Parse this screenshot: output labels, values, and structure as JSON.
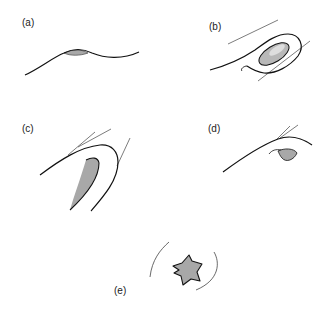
{
  "figure": {
    "panels": [
      {
        "id": "a",
        "label": "(a)",
        "description": "single wavy contour with a thin shaded lens on its crest"
      },
      {
        "id": "b",
        "label": "(b)",
        "description": "contour curving into a rounded loop enclosing a shaded ellipse, with two tangent lines"
      },
      {
        "id": "c",
        "label": "(c)",
        "description": "arched contour with tangent lines and an elongated shaded wedge inside the curve"
      },
      {
        "id": "d",
        "label": "(d)",
        "description": "contour with tangent lines at its peak and a small shaded almond shape below"
      },
      {
        "id": "e",
        "label": "(e)",
        "description": "shaded star-like blob with concave edges between two bracketing arcs"
      }
    ],
    "colors": {
      "stroke": "#111111",
      "thin_stroke": "#444444",
      "fill": "#a8a8a8",
      "ellipse_fill": "#b8b8b8",
      "background": "#ffffff"
    }
  }
}
